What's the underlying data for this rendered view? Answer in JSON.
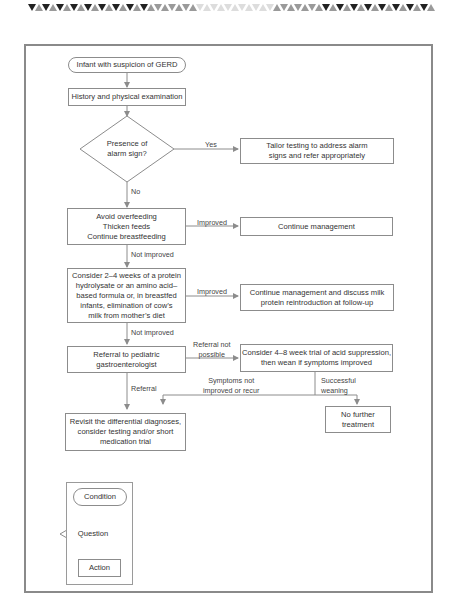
{
  "decoration": {
    "top_triangle_band": {
      "colors": [
        "#222222",
        "#9a9a9a",
        "#dddddd"
      ]
    }
  },
  "flowchart": {
    "start": {
      "label": "Infant with suspicion of GERD",
      "shape": "condition"
    },
    "history": {
      "label": "History and physical examination",
      "shape": "action"
    },
    "alarm_question": {
      "label": "Presence of\nalarm sign?",
      "shape": "question"
    },
    "alarm_yes_label": "Yes",
    "alarm_yes_action": {
      "label": "Tailor testing to address alarm\nsigns and refer appropriately",
      "shape": "action"
    },
    "alarm_no_label": "No",
    "feeding": {
      "label": "Avoid overfeeding\nThicken feeds\nContinue breastfeeding",
      "shape": "action"
    },
    "feeding_improved_label": "Improved",
    "continue_management": {
      "label": "Continue management",
      "shape": "action"
    },
    "feeding_not_improved_label": "Not improved",
    "formula": {
      "label": "Consider 2–4 weeks of a protein\nhydrolysate or an amino acid–\nbased formula or, in breastfed\ninfants, elimination of cow’s\nmilk from mother’s diet",
      "shape": "action"
    },
    "formula_improved_label": "Improved",
    "milk_reintroduction": {
      "label": "Continue management and discuss milk\nprotein reintroduction at follow-up",
      "shape": "action"
    },
    "formula_not_improved_label": "Not improved",
    "referral": {
      "label": "Referral to pediatric\ngastroenterologist",
      "shape": "action"
    },
    "referral_not_possible_label": "Referral not\npossible",
    "acid_suppression": {
      "label": "Consider 4–8 week trial of acid suppression,\nthen wean if symptoms improved",
      "shape": "action"
    },
    "symptoms_not_improved_label": "Symptoms not\nimproved or recur",
    "successful_weaning_label": "Successful\nweaning",
    "no_further": {
      "label": "No further\ntreatment",
      "shape": "action"
    },
    "referral_label": "Referral",
    "revisit": {
      "label": "Revisit the differential diagnoses,\nconsider testing and/or short\nmedication trial",
      "shape": "action"
    }
  },
  "legend": {
    "condition": "Condition",
    "question": "Question",
    "action": "Action"
  },
  "colors": {
    "line": "#8c8c8c",
    "frame": "#8a8a8a",
    "text": "#333333"
  }
}
